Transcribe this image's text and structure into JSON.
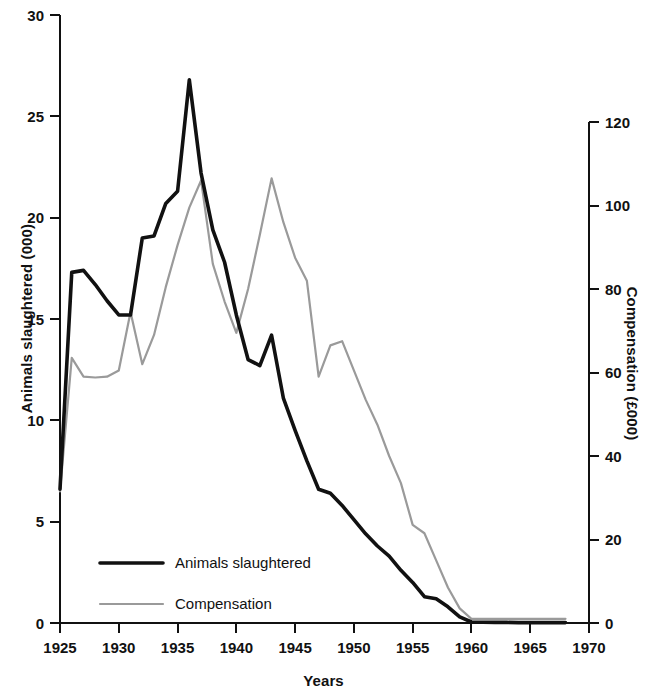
{
  "chart_data": {
    "type": "line",
    "title": "",
    "xlabel": "Years",
    "ylabel": "Animals slaughtered (000)",
    "ylabel_right": "Compensation (£000)",
    "xlim": [
      1925,
      1970
    ],
    "ylim": [
      0,
      30
    ],
    "ylim_right": [
      0,
      130
    ],
    "grid": false,
    "legend_position": "inside-lower-left",
    "x_ticks": [
      1925,
      1930,
      1935,
      1940,
      1945,
      1950,
      1955,
      1960,
      1965,
      1970
    ],
    "y_ticks_left": [
      0,
      5,
      10,
      15,
      20,
      25,
      30
    ],
    "y_ticks_right": [
      0,
      20,
      40,
      60,
      80,
      100,
      120
    ],
    "colors": {
      "slaughtered": "#111111",
      "compensation": "#9a9a9a",
      "axis": "#111111",
      "background": "#ffffff"
    },
    "x": [
      1925,
      1926,
      1927,
      1928,
      1929,
      1930,
      1931,
      1932,
      1933,
      1934,
      1935,
      1936,
      1937,
      1938,
      1939,
      1940,
      1941,
      1942,
      1943,
      1944,
      1945,
      1946,
      1947,
      1948,
      1949,
      1950,
      1951,
      1952,
      1953,
      1954,
      1955,
      1956,
      1957,
      1958,
      1959,
      1960,
      1961,
      1962,
      1963,
      1964,
      1965,
      1966,
      1967,
      1968
    ],
    "series": [
      {
        "name": "Animals slaughtered",
        "axis": "left",
        "units": "thousands",
        "values": [
          6.6,
          17.3,
          17.4,
          16.7,
          15.9,
          15.2,
          15.2,
          19.0,
          19.1,
          20.7,
          21.3,
          26.8,
          22.2,
          19.4,
          17.8,
          15.2,
          13.0,
          12.7,
          14.2,
          11.1,
          9.5,
          8.0,
          6.6,
          6.4,
          5.8,
          5.1,
          4.4,
          3.8,
          3.3,
          2.6,
          2.0,
          1.3,
          1.2,
          0.8,
          0.3,
          0.05,
          0.04,
          0.03,
          0.03,
          0.02,
          0.02,
          0.02,
          0.02,
          0.02
        ]
      },
      {
        "name": "Compensation",
        "axis": "right",
        "units": "£000",
        "values": [
          31.5,
          63.5,
          59.0,
          58.8,
          59.0,
          60.5,
          74.5,
          62.0,
          69.0,
          80.5,
          90.5,
          99.5,
          106.0,
          86.0,
          77.0,
          69.5,
          80.0,
          93.0,
          106.5,
          96.0,
          87.5,
          82.0,
          59.0,
          66.5,
          67.5,
          60.5,
          53.5,
          47.5,
          40.0,
          33.5,
          23.5,
          21.5,
          15.0,
          8.5,
          3.5,
          1.0,
          1.0,
          1.0,
          1.0,
          1.0,
          1.0,
          1.0,
          1.0,
          1.0
        ]
      }
    ],
    "legend": [
      {
        "label": "Animals slaughtered",
        "color": "#111111",
        "style": "thick-solid"
      },
      {
        "label": "Compensation",
        "color": "#9a9a9a",
        "style": "thin-solid"
      }
    ]
  }
}
